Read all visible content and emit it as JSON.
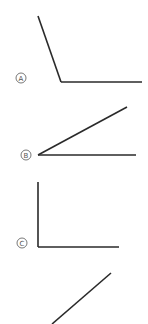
{
  "figure": {
    "line_color": "#2a2a2a",
    "label_color": "#555555",
    "options": [
      {
        "letter": "A",
        "angle_type": "obtuse",
        "label_pos": [
          21,
          78
        ],
        "segments": [
          [
            38,
            16,
            61,
            82
          ],
          [
            61,
            82,
            142,
            82
          ]
        ]
      },
      {
        "letter": "B",
        "angle_type": "acute",
        "label_pos": [
          26,
          155
        ],
        "segments": [
          [
            38,
            155,
            127,
            107
          ],
          [
            38,
            155,
            136,
            155
          ]
        ]
      },
      {
        "letter": "C",
        "angle_type": "right",
        "label_pos": [
          22,
          243
        ],
        "segments": [
          [
            38,
            182,
            38,
            247
          ],
          [
            38,
            247,
            119,
            247
          ]
        ]
      },
      {
        "letter": "D",
        "angle_type": "partial",
        "label_pos": null,
        "segments": [
          [
            52,
            324,
            111,
            273
          ]
        ]
      }
    ]
  }
}
